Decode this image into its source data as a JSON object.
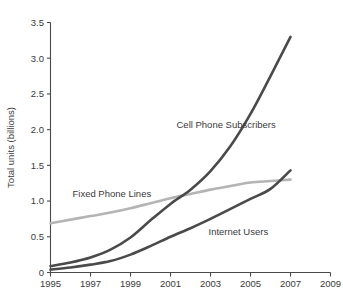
{
  "chart_data": {
    "type": "line",
    "title": "",
    "subtitle": "",
    "xlabel": "",
    "ylabel": "Total units (billions)",
    "xlim": [
      1995,
      2009
    ],
    "ylim": [
      0,
      3.5
    ],
    "grid": false,
    "legend_position": "inline-annotations",
    "x_ticks": [
      "1995",
      "1997",
      "1999",
      "2001",
      "2003",
      "2005",
      "2007",
      "2009"
    ],
    "x_tick_values": [
      1995,
      1997,
      1999,
      2001,
      2003,
      2005,
      2007,
      2009
    ],
    "y_ticks": [
      "0",
      "0.5",
      "1.0",
      "1.5",
      "2.0",
      "2.5",
      "3.0",
      "3.5"
    ],
    "y_tick_values": [
      0,
      0.5,
      1.0,
      1.5,
      2.0,
      2.5,
      3.0,
      3.5
    ],
    "x": [
      1995,
      1996,
      1997,
      1998,
      1999,
      2000,
      2001,
      2002,
      2003,
      2004,
      2005,
      2006,
      2007
    ],
    "series": [
      {
        "name": "Cell Phone Subscribers",
        "color": "#4a4a4a",
        "width": 2.6,
        "values": [
          0.09,
          0.14,
          0.21,
          0.32,
          0.49,
          0.73,
          0.96,
          1.16,
          1.42,
          1.77,
          2.22,
          2.75,
          3.3
        ],
        "label_x": 2001.3,
        "label_y": 2.02
      },
      {
        "name": "Fixed Phone Lines",
        "color": "#b4b4b4",
        "width": 2.6,
        "values": [
          0.69,
          0.74,
          0.79,
          0.84,
          0.9,
          0.97,
          1.04,
          1.1,
          1.16,
          1.21,
          1.26,
          1.28,
          1.3
        ],
        "label_x": 1996.1,
        "label_y": 1.06
      },
      {
        "name": "Internet Users",
        "color": "#4a4a4a",
        "width": 2.6,
        "values": [
          0.04,
          0.07,
          0.11,
          0.16,
          0.25,
          0.37,
          0.5,
          0.62,
          0.75,
          0.89,
          1.03,
          1.17,
          1.43
        ],
        "label_x": 2002.9,
        "label_y": 0.53
      }
    ]
  }
}
